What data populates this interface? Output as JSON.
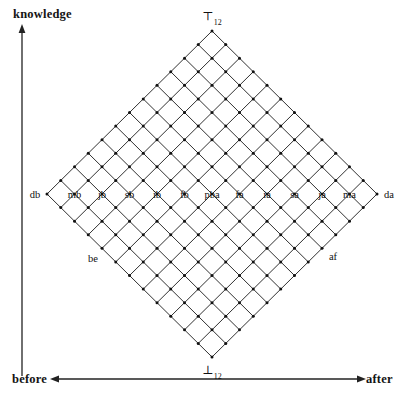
{
  "figure": {
    "axes": {
      "vertical_label": "knowledge",
      "horizontal_left_label": "before",
      "horizontal_right_label": "after"
    },
    "apex": {
      "top_symbol": "⊤",
      "top_subscript": "12",
      "bottom_symbol": "⊥",
      "bottom_subscript": "12"
    },
    "midline_labels": [
      "db",
      "mb",
      "jb",
      "sb",
      "ib",
      "fb",
      "pba",
      "fa",
      "ia",
      "sa",
      "ja",
      "ma",
      "da"
    ],
    "interior_labels": [
      {
        "text": "be"
      },
      {
        "text": "af"
      }
    ],
    "colors": {
      "line": "#1a1a1a",
      "node": "#111111",
      "axis": "#222222",
      "background": "#ffffff"
    },
    "geometry": {
      "grid_size": 12,
      "center_x": 212,
      "center_y": 194,
      "half_width": 165,
      "half_height": 163
    }
  }
}
